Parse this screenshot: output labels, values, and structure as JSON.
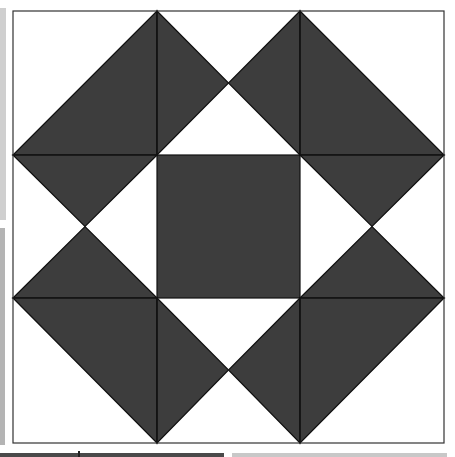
{
  "figure": {
    "colors": {
      "dark": "#3d3d3d",
      "light": "#ffffff",
      "line": "#111111"
    },
    "grid": {
      "x": [
        13,
        157,
        300,
        444
      ],
      "y": [
        11,
        155,
        298,
        443
      ]
    }
  }
}
